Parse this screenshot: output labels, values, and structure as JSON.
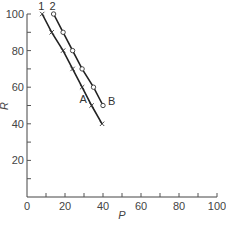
{
  "chart_data": {
    "type": "line",
    "title": "",
    "xlabel": "P",
    "ylabel": "R",
    "xlim": [
      0,
      100
    ],
    "ylim": [
      0,
      100
    ],
    "x_ticks": [
      0,
      20,
      40,
      60,
      80,
      100
    ],
    "y_ticks": [
      20,
      40,
      60,
      80,
      100
    ],
    "x_tick_labels": [
      "0",
      "20",
      "40",
      "60",
      "80",
      "100"
    ],
    "y_tick_labels": [
      "20",
      "40",
      "60",
      "80",
      "100"
    ],
    "x_minor_step": 10,
    "y_minor_step": 10,
    "grid": false,
    "series": [
      {
        "name": "1",
        "marker": "x",
        "end_label": "A",
        "x": [
          8,
          13,
          19,
          24,
          29,
          34,
          39.5
        ],
        "y": [
          100,
          90,
          80,
          70,
          60,
          50,
          40
        ]
      },
      {
        "name": "2",
        "marker": "o",
        "end_label": "B",
        "x": [
          14,
          19,
          24,
          29,
          35,
          40
        ],
        "y": [
          100,
          90,
          80,
          70,
          60,
          50
        ]
      }
    ]
  }
}
